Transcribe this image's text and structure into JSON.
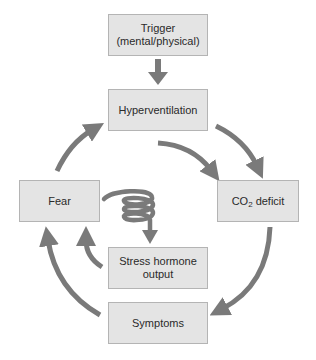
{
  "diagram": {
    "type": "cycle-flowchart",
    "colors": {
      "box_fill": "#e4e4e4",
      "box_border": "#b4b4b4",
      "arrow": "#7a7a7a",
      "text": "#2a2a2a"
    },
    "nodes": {
      "trigger": {
        "line1": "Trigger",
        "line2": "(mental/physical)"
      },
      "hyperventilation": {
        "label": "Hyperventilation"
      },
      "co2_deficit": {
        "prefix": "CO",
        "subscript": "2",
        "suffix": " deficit"
      },
      "symptoms": {
        "label": "Symptoms"
      },
      "stress_hormone": {
        "line1": "Stress hormone",
        "line2": "output"
      },
      "fear": {
        "label": "Fear"
      }
    },
    "edges": [
      {
        "from": "Trigger (mental/physical)",
        "to": "Hyperventilation",
        "style": "straight"
      },
      {
        "from": "Hyperventilation",
        "to": "CO2 deficit",
        "style": "curved"
      },
      {
        "from": "Hyperventilation",
        "to": "CO2 deficit",
        "style": "curved-inner"
      },
      {
        "from": "CO2 deficit",
        "to": "Symptoms",
        "style": "curved"
      },
      {
        "from": "Symptoms",
        "to": "Fear",
        "style": "curved"
      },
      {
        "from": "Stress hormone output",
        "to": "Fear",
        "style": "curved"
      },
      {
        "from": "Fear",
        "to": "Stress hormone output",
        "style": "spiral"
      },
      {
        "from": "Fear",
        "to": "Hyperventilation",
        "style": "curved"
      }
    ]
  }
}
